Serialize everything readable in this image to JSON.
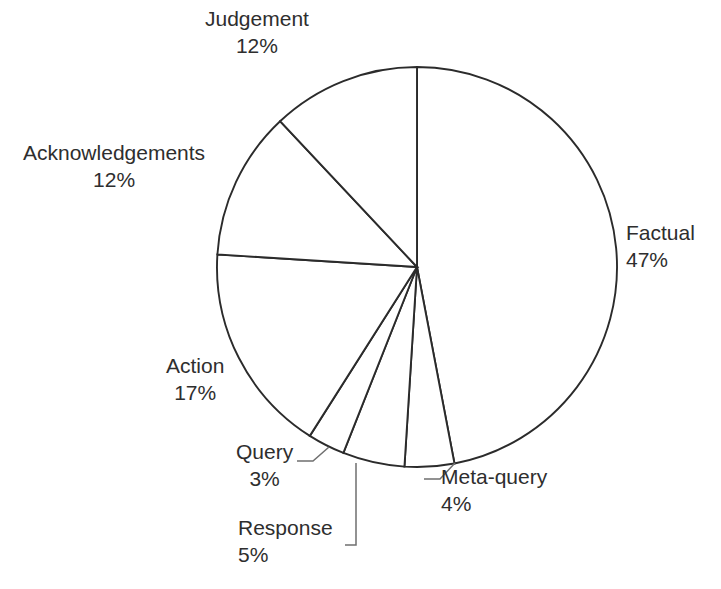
{
  "figure": {
    "background_color": "#ffffff",
    "outline_color": "#2b2b2b",
    "text_color": "#2e2e2e",
    "leader_color": "#6f6f6f"
  },
  "chart_data": {
    "type": "pie",
    "title": "",
    "subtitle": "",
    "xlabel": "",
    "ylabel": "",
    "grid": false,
    "legend_position": "none",
    "label_format": "name and percentage outside slices with leader lines for small slices",
    "start_angle_deg": 90,
    "direction": "clockwise",
    "center_px": [
      417,
      267
    ],
    "radius_px": 200,
    "categories": [
      "Factual",
      "Meta-query",
      "Response",
      "Query",
      "Action",
      "Acknowledgements",
      "Judgement"
    ],
    "values": [
      47,
      4,
      5,
      3,
      17,
      12,
      12
    ],
    "slices": [
      {
        "name": "Factual",
        "percent": 47,
        "label": "Factual",
        "percent_label": "47%",
        "label_x": 626,
        "label_y": 219,
        "align": "left",
        "leader": false
      },
      {
        "name": "Meta-query",
        "percent": 4,
        "label": "Meta-query",
        "percent_label": "4%",
        "label_x": 441,
        "label_y": 463,
        "align": "left",
        "leader": true
      },
      {
        "name": "Response",
        "percent": 5,
        "label": "Response",
        "percent_label": "5%",
        "label_x": 238,
        "label_y": 514,
        "align": "left",
        "leader": true
      },
      {
        "name": "Query",
        "percent": 3,
        "label": "Query",
        "percent_label": "3%",
        "label_x": 236,
        "label_y": 438,
        "align": "center",
        "leader": true
      },
      {
        "name": "Action",
        "percent": 17,
        "label": "Action",
        "percent_label": "17%",
        "label_x": 166,
        "label_y": 352,
        "align": "center",
        "leader": false
      },
      {
        "name": "Acknowledgements",
        "percent": 12,
        "label": "Acknowledgements",
        "percent_label": "12%",
        "label_x": 23,
        "label_y": 139,
        "align": "center",
        "leader": false
      },
      {
        "name": "Judgement",
        "percent": 12,
        "label": "Judgement",
        "percent_label": "12%",
        "label_x": 205,
        "label_y": 5,
        "align": "center",
        "leader": false
      }
    ]
  }
}
